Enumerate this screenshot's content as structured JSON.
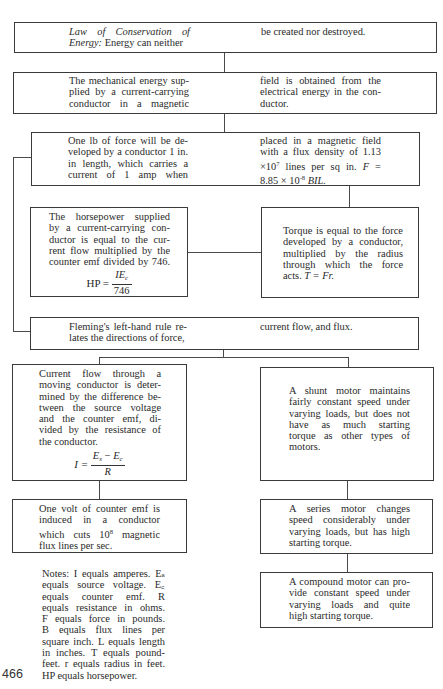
{
  "page_number": "466",
  "boxes": {
    "conservation": {
      "left_lines": [
        "Law of Conservation of",
        "Energy: Energy can neither"
      ],
      "left_italic_prefix_1": "Law of Conservation of",
      "left_italic_prefix_2": "Energy:",
      "left_rest_2": " Energy can neither",
      "right_lines": [
        "be created nor destroyed."
      ]
    },
    "mechanical_energy": {
      "left_lines": [
        "The mechanical energy sup-",
        "plied by a current-carrying",
        "conductor in a magnetic"
      ],
      "right_lines": [
        "field is obtained from the",
        "electrical energy in the con-",
        "ductor."
      ]
    },
    "force": {
      "left_lines": [
        "One lb of force will be de-",
        "veloped by a conductor 1 in.",
        "in length, which carries a",
        "current of 1 amp when"
      ],
      "right_lines": [
        "placed in a magnetic field",
        "with a flux density of 1.13",
        "×10⁷ lines per sq in. F =",
        "8.85 × 10⁻⁸ BIL."
      ],
      "right_line3_a": "×10",
      "right_line3_sup": "7",
      "right_line3_b": " lines per sq in. ",
      "right_line3_var": "F",
      "right_line3_c": " =",
      "right_line4_a": "8.85 × 10",
      "right_line4_sup": "-8",
      "right_line4_var": " BIL."
    },
    "horsepower": {
      "lines": [
        "The horsepower supplied",
        "by a current-carrying con-",
        "ductor is equal to the cur-",
        "rent flow multiplied by the",
        "counter emf divided by 746."
      ],
      "formula_lhs": "HP =",
      "formula_num_base": "IE",
      "formula_num_sub": "c",
      "formula_den": "746"
    },
    "torque": {
      "lines": [
        "Torque is equal to the force",
        "developed by a conductor,",
        "multiplied by the radius",
        "through which the force"
      ],
      "last_line_prefix": "acts. ",
      "last_line_formula": "T = Fr."
    },
    "fleming": {
      "left_lines": [
        "Fleming's left-hand rule re-",
        "lates the directions of force,"
      ],
      "right_lines": [
        "current flow, and flux."
      ]
    },
    "current_flow": {
      "lines": [
        "Current flow through a",
        "moving conductor is deter-",
        "mined by the difference be-",
        "tween the source voltage",
        "and the counter emf, di-",
        "vided by the resistance of",
        "the conductor."
      ],
      "formula_lhs": "I =",
      "formula_num_a": "E",
      "formula_num_a_sub": "s",
      "formula_minus": " − ",
      "formula_num_b": "E",
      "formula_num_b_sub": "c",
      "formula_den": "R"
    },
    "shunt": {
      "lines": [
        "A shunt motor maintains",
        "fairly constant speed under",
        "varying loads, but does not",
        "have as much starting",
        "torque as other types of",
        "motors."
      ]
    },
    "counter_emf": {
      "lines": [
        "One volt of counter emf is",
        "induced in a conductor",
        "which cuts 10⁸ magnetic",
        "flux lines per sec."
      ],
      "line3_a": "which cuts 10",
      "line3_sup": "8",
      "line3_b": " magnetic"
    },
    "series": {
      "lines": [
        "A series motor changes",
        "speed considerably under",
        "varying loads, but has high",
        "starting torque."
      ]
    },
    "compound": {
      "lines": [
        "A compound motor can pro-",
        "vide constant speed under",
        "varying loads and quite",
        "high starting torque."
      ]
    }
  },
  "notes": {
    "label": "Notes:",
    "lines": [
      "Notes: I equals amperes. Eₛ",
      "equals source voltage. E꜀",
      "equals counter emf. R",
      "equals resistance in ohms.",
      "F equals force in pounds.",
      "B equals flux lines per",
      "square inch. L equals length",
      "in inches. T equals pound-",
      "feet. r equals radius in feet.",
      "HP equals horsepower."
    ]
  }
}
